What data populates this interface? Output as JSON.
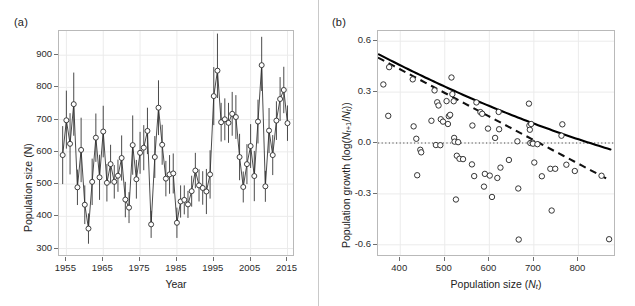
{
  "figure": {
    "width": 635,
    "height": 306,
    "background": "#ffffff",
    "marker_color": "#2b2b2b",
    "grid_color": "#ebebeb",
    "border_color": "#b9b9b9"
  },
  "panels": [
    {
      "id": "a",
      "label": "(a)",
      "xlabel": "Year",
      "ylabel": "Population size (N)"
    },
    {
      "id": "b",
      "label": "(b)",
      "xlabel_html": "Population size (<i>N</i><sub><i>t</i></sub>)",
      "xlabel": "Population size (Nt)",
      "ylabel_html": "Population growth (log(<i>N</i><sub><i>t</i>+1</sub>/<i>N</i><sub><i>t</i></sub>))",
      "ylabel": "Population growth (log(Nt+1/Nt))"
    }
  ],
  "chart_data": [
    {
      "type": "line",
      "panel": "a",
      "title": "(a)",
      "xlabel": "Year",
      "ylabel": "Population size (N)",
      "xlim": [
        1953.0,
        2016.5
      ],
      "ylim": [
        280,
        975
      ],
      "xticks": [
        1955,
        1965,
        1975,
        1985,
        1995,
        2005,
        2015
      ],
      "yticks": [
        300,
        400,
        500,
        600,
        700,
        800,
        900
      ],
      "grid": true,
      "marker": "open-circle",
      "errorbars": true,
      "x": [
        1954,
        1955,
        1956,
        1957,
        1958,
        1959,
        1960,
        1961,
        1962,
        1963,
        1964,
        1965,
        1966,
        1967,
        1968,
        1969,
        1970,
        1971,
        1972,
        1973,
        1974,
        1975,
        1976,
        1977,
        1978,
        1979,
        1980,
        1981,
        1982,
        1983,
        1984,
        1985,
        1986,
        1987,
        1988,
        1989,
        1990,
        1991,
        1992,
        1993,
        1994,
        1995,
        1996,
        1997,
        1998,
        1999,
        2000,
        2001,
        2002,
        2003,
        2004,
        2005,
        2006,
        2007,
        2008,
        2009,
        2010,
        2011,
        2012,
        2013,
        2014,
        2015
      ],
      "y": [
        590,
        698,
        625,
        748,
        490,
        606,
        436,
        362,
        507,
        644,
        521,
        663,
        504,
        562,
        507,
        526,
        581,
        452,
        427,
        621,
        515,
        597,
        613,
        665,
        375,
        584,
        737,
        622,
        517,
        530,
        533,
        380,
        446,
        451,
        437,
        478,
        542,
        496,
        488,
        477,
        530,
        773,
        852,
        692,
        701,
        690,
        718,
        708,
        584,
        491,
        562,
        618,
        525,
        694,
        869,
        493,
        666,
        590,
        697,
        764,
        792,
        689,
        762
      ],
      "yerr_low": [
        90,
        88,
        95,
        98,
        55,
        100,
        60,
        47,
        72,
        75,
        70,
        80,
        58,
        60,
        52,
        50,
        70,
        55,
        48,
        92,
        60,
        65,
        70,
        72,
        42,
        65,
        85,
        62,
        55,
        60,
        62,
        47,
        50,
        45,
        42,
        48,
        55,
        50,
        52,
        70,
        75,
        90,
        85,
        60,
        65,
        62,
        68,
        68,
        72,
        48,
        62,
        68,
        78,
        68,
        80,
        48,
        70,
        62,
        60,
        68,
        72,
        55,
        68
      ],
      "yerr_high": [
        90,
        92,
        95,
        98,
        55,
        100,
        60,
        47,
        72,
        75,
        70,
        80,
        58,
        60,
        52,
        50,
        70,
        55,
        48,
        92,
        60,
        65,
        70,
        72,
        42,
        65,
        85,
        62,
        55,
        60,
        62,
        47,
        50,
        45,
        42,
        48,
        55,
        50,
        52,
        70,
        75,
        90,
        115,
        60,
        65,
        62,
        68,
        68,
        72,
        48,
        62,
        68,
        78,
        68,
        88,
        48,
        70,
        62,
        60,
        68,
        72,
        55,
        68
      ],
      "series_note": "population counts with uncertainty bars, open circle markers joined by straight segments"
    },
    {
      "type": "scatter",
      "panel": "b",
      "title": "(b)",
      "xlabel": "Population size (Nt)",
      "ylabel": "Population growth (log(Nt+1/Nt))",
      "xlim": [
        350,
        880
      ],
      "ylim": [
        -0.66,
        0.66
      ],
      "xticks": [
        400,
        500,
        600,
        700,
        800
      ],
      "yticks": [
        -0.6,
        -0.3,
        0.0,
        0.3,
        0.6
      ],
      "ytick_labels": [
        "-0.6",
        "-0.3",
        "0.0",
        "0.3",
        "0.6"
      ],
      "grid": true,
      "marker": "open-circle",
      "reference_line": {
        "type": "dotted",
        "y": 0.0
      },
      "fits": [
        {
          "name": "solid-fit",
          "style": "solid",
          "description": "curved negative density-dependence fit"
        },
        {
          "name": "dashed-fit",
          "style": "dashed",
          "description": "alternative linear/Ricker fit"
        }
      ],
      "points": [
        [
          362,
          0.345
        ],
        [
          375,
          0.447
        ],
        [
          373,
          0.16
        ],
        [
          428,
          0.375
        ],
        [
          430,
          0.098
        ],
        [
          436,
          0.025
        ],
        [
          438,
          -0.19
        ],
        [
          445,
          -0.04
        ],
        [
          447,
          -0.055
        ],
        [
          470,
          0.131
        ],
        [
          477,
          0.31
        ],
        [
          480,
          -0.012
        ],
        [
          483,
          0.24
        ],
        [
          486,
          0.221
        ],
        [
          490,
          -0.013
        ],
        [
          491,
          0.14
        ],
        [
          496,
          0.126
        ],
        [
          504,
          0.247
        ],
        [
          507,
          0.112
        ],
        [
          509,
          0.158
        ],
        [
          512,
          0.166
        ],
        [
          515,
          0.386
        ],
        [
          517,
          0.288
        ],
        [
          520,
          0.246
        ],
        [
          521,
          0.03
        ],
        [
          522,
          0.008
        ],
        [
          525,
          -0.333
        ],
        [
          527,
          -0.075
        ],
        [
          530,
          0.005
        ],
        [
          533,
          -0.093
        ],
        [
          541,
          -0.095
        ],
        [
          561,
          -0.126
        ],
        [
          562,
          0.103
        ],
        [
          566,
          -0.195
        ],
        [
          571,
          0.239
        ],
        [
          580,
          0.182
        ],
        [
          584,
          0.172
        ],
        [
          588,
          -0.257
        ],
        [
          590,
          -0.182
        ],
        [
          597,
          0.085
        ],
        [
          601,
          -0.192
        ],
        [
          606,
          -0.318
        ],
        [
          613,
          0.03
        ],
        [
          618,
          -0.206
        ],
        [
          621,
          0.183
        ],
        [
          622,
          0.081
        ],
        [
          625,
          -0.145
        ],
        [
          644,
          -0.1
        ],
        [
          663,
          0.01
        ],
        [
          665,
          -0.268
        ],
        [
          666,
          -0.569
        ],
        [
          689,
          0.232
        ],
        [
          690,
          0.103
        ],
        [
          691,
          0.078
        ],
        [
          692,
          0.0
        ],
        [
          694,
          0.112
        ],
        [
          697,
          0.002
        ],
        [
          698,
          -0.004
        ],
        [
          701,
          -0.115
        ],
        [
          708,
          -0.007
        ],
        [
          718,
          -0.196
        ],
        [
          737,
          -0.152
        ],
        [
          740,
          -0.398
        ],
        [
          748,
          -0.152
        ],
        [
          762,
          0.043
        ],
        [
          764,
          0.11
        ],
        [
          773,
          -0.128
        ],
        [
          792,
          -0.165
        ],
        [
          852,
          -0.193
        ],
        [
          869,
          -0.567
        ]
      ]
    }
  ]
}
